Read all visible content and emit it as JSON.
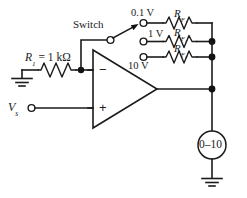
{
  "figure": {
    "background": "#ffffff",
    "ink": "#1b1b1b"
  },
  "labels": {
    "switch": "Switch",
    "r1": "R",
    "r1_sub": "1",
    "r1_value": " = 1 kΩ",
    "vs": "V",
    "vs_sub": "s",
    "source_01v": "0.1 V",
    "source_1v": "1 V",
    "source_10v": "10 V",
    "rf1": "R",
    "rf1_sub": "F₁",
    "rf2": "R",
    "rf2_sub": "F₂",
    "rf3": "R",
    "rf3_sub": "F₃",
    "meter": "0–10",
    "minus_input": "−",
    "plus_input": "+"
  },
  "components": {
    "opamp": {
      "name": "operational-amplifier"
    },
    "meter": {
      "name": "panel-meter",
      "range": "0–10"
    },
    "resistors": [
      "R1",
      "RF1",
      "RF2",
      "RF3"
    ],
    "grounds": [
      "input-ground",
      "meter-ground"
    ],
    "terminals": [
      "0.1 V",
      "1 V",
      "10 V",
      "Vs"
    ]
  }
}
